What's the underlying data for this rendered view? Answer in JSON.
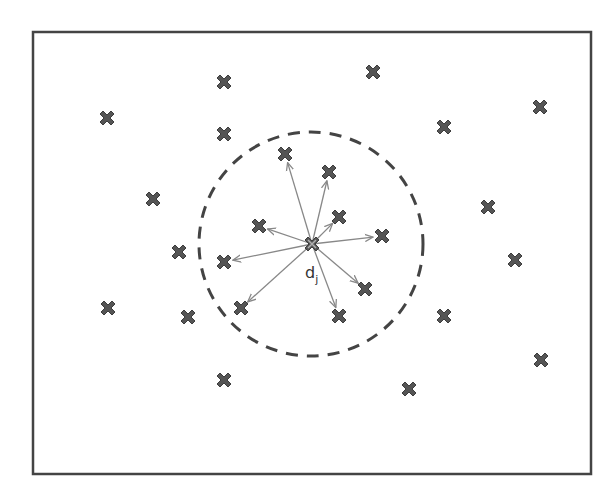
{
  "diagram": {
    "type": "neighborhood-scatter",
    "frame": {
      "x": 33,
      "y": 32,
      "width": 558,
      "height": 442,
      "stroke": "#444444"
    },
    "colors": {
      "marker": "#555555",
      "marker_center": "#7a7a7a",
      "arrow": "#888888",
      "circle": "#444444"
    },
    "center": {
      "x": 312,
      "y": 244,
      "label": "d",
      "label_sub": "j",
      "label_x": 305,
      "label_y": 278
    },
    "radius_circle": {
      "cx": 311,
      "cy": 244,
      "r": 112,
      "style": "dashed"
    },
    "neighbors": [
      {
        "x": 285,
        "y": 154
      },
      {
        "x": 329,
        "y": 172
      },
      {
        "x": 339,
        "y": 217
      },
      {
        "x": 259,
        "y": 226
      },
      {
        "x": 382,
        "y": 236
      },
      {
        "x": 224,
        "y": 262
      },
      {
        "x": 241,
        "y": 308
      },
      {
        "x": 365,
        "y": 289
      },
      {
        "x": 339,
        "y": 316
      }
    ],
    "others": [
      {
        "x": 107,
        "y": 118
      },
      {
        "x": 224,
        "y": 82
      },
      {
        "x": 373,
        "y": 72
      },
      {
        "x": 224,
        "y": 134
      },
      {
        "x": 444,
        "y": 127
      },
      {
        "x": 540,
        "y": 107
      },
      {
        "x": 153,
        "y": 199
      },
      {
        "x": 488,
        "y": 207
      },
      {
        "x": 179,
        "y": 252
      },
      {
        "x": 515,
        "y": 260
      },
      {
        "x": 108,
        "y": 308
      },
      {
        "x": 188,
        "y": 317
      },
      {
        "x": 444,
        "y": 316
      },
      {
        "x": 541,
        "y": 360
      },
      {
        "x": 224,
        "y": 380
      },
      {
        "x": 409,
        "y": 389
      }
    ]
  }
}
